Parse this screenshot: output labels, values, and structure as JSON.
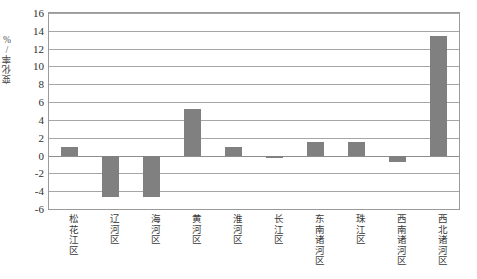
{
  "chart_data": {
    "type": "bar",
    "title": "",
    "xlabel": "",
    "ylabel": "变化率/%",
    "ylim": [
      -6,
      16
    ],
    "ytick_step": 2,
    "yticks": [
      "16",
      "14",
      "12",
      "10",
      "8",
      "6",
      "4",
      "2",
      "0",
      "-2",
      "-4",
      "-6"
    ],
    "grid": true,
    "legend": "none",
    "bar_color": "#808080",
    "plot_border_color": "#9a9a9a",
    "gridline_color": "#a6a6a6",
    "categories": [
      "松花江区",
      "辽河区",
      "海河区",
      "黄河区",
      "淮河区",
      "长江区",
      "东南诸河区",
      "珠江区",
      "西南诸河区",
      "西北诸河区"
    ],
    "values": [
      1.0,
      -4.6,
      -4.6,
      5.2,
      1.0,
      -0.3,
      1.5,
      1.5,
      -0.7,
      13.4
    ]
  }
}
